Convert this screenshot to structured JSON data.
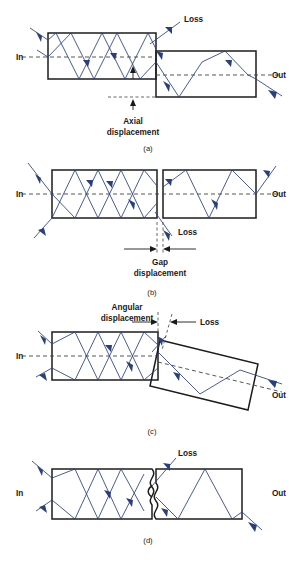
{
  "figure": {
    "title_caption": "",
    "colors": {
      "background": "#ffffff",
      "fiber_outline": "#1c1c1c",
      "ray": "#2b3f7a",
      "axis_dash": "#444444",
      "text": "#1a1a1a"
    }
  },
  "panels": [
    {
      "id": "(a)",
      "name": "axial-displacement",
      "labels": {
        "in": "In",
        "out": "Out",
        "loss": "Loss",
        "dimension_line1": "Axial",
        "dimension_line2": "displacement"
      }
    },
    {
      "id": "(b)",
      "name": "gap-displacement",
      "labels": {
        "in": "In",
        "out": "Out",
        "loss": "Loss",
        "dimension_line1": "Gap",
        "dimension_line2": "displacement"
      }
    },
    {
      "id": "(c)",
      "name": "angular-displacement",
      "labels": {
        "in": "In",
        "out": "Out",
        "loss": "Loss",
        "dimension_line1": "Angular",
        "dimension_line2": "displacement"
      }
    },
    {
      "id": "(d)",
      "name": "surface-irregularity",
      "labels": {
        "in": "In",
        "out": "Out",
        "loss": "Loss"
      }
    }
  ]
}
